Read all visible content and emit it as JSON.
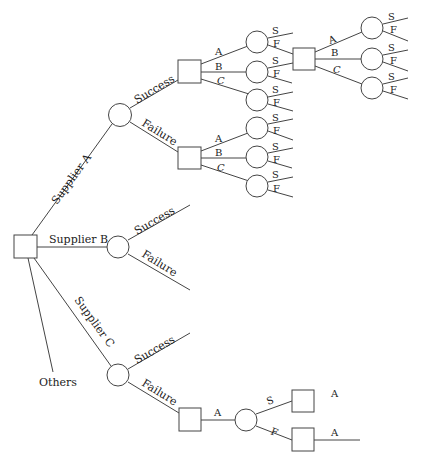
{
  "diagram": {
    "type": "decision-tree",
    "root": {
      "branches": [
        {
          "label": "Supplier A"
        },
        {
          "label": "Supplier B"
        },
        {
          "label": "Supplier C"
        },
        {
          "label": "Others"
        }
      ]
    },
    "supplier_a": {
      "success_label": "Success",
      "failure_label": "Failure",
      "success_options": [
        "A",
        "B",
        "C"
      ],
      "failure_options": [
        "A",
        "B",
        "C"
      ],
      "outcome_labels": [
        "S",
        "F"
      ],
      "second_stage_options": [
        "A",
        "B",
        "C"
      ]
    },
    "supplier_b": {
      "success_label": "Success",
      "failure_label": "Failure"
    },
    "supplier_c": {
      "success_label": "Success",
      "failure_label": "Failure",
      "failure_option": "A",
      "outcome_s": "S",
      "outcome_f": "F",
      "after_s_option": "A",
      "after_f_option": "A"
    },
    "colors": {
      "line": "#444444",
      "highlight_line_start": "#2aa198",
      "highlight_line_end": "#e05050"
    }
  }
}
